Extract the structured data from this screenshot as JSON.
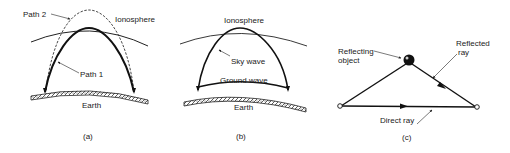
{
  "figure": {
    "panels": [
      {
        "id": "a",
        "caption": "(a)",
        "labels": {
          "path2": "Path 2",
          "ionosphere": "Ionosphere",
          "path1": "Path 1",
          "earth": "Earth"
        }
      },
      {
        "id": "b",
        "caption": "(b)",
        "labels": {
          "ionosphere": "Ionosphere",
          "sky_wave": "Sky wave",
          "ground_wave": "Ground wave",
          "earth": "Earth"
        }
      },
      {
        "id": "c",
        "caption": "(c)",
        "labels": {
          "reflecting_object_line1": "Reflecting",
          "reflecting_object_line2": "object",
          "reflected_ray_line1": "Reflected",
          "reflected_ray_line2": "ray",
          "direct_ray": "Direct ray"
        }
      }
    ]
  }
}
